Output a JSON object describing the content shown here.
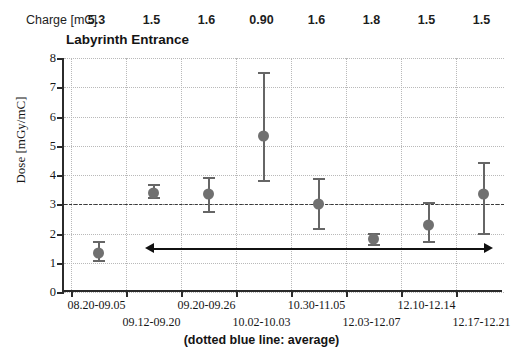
{
  "header": {
    "charge_label": "Charge [mC]",
    "charge_values": [
      "5.3",
      "1.5",
      "1.6",
      "0.90",
      "1.6",
      "1.8",
      "1.5",
      "1.5"
    ]
  },
  "caption": "(dotted blue line: average)",
  "chart_data": {
    "type": "scatter",
    "title": "Labyrinth Entrance",
    "xlabel": "",
    "ylabel": "Dose [mGy/mC]",
    "ylim": [
      0,
      8
    ],
    "yticks": [
      "0",
      "1",
      "2",
      "3",
      "4",
      "5",
      "6",
      "7",
      "8"
    ],
    "grid": true,
    "legend": "none",
    "categories": [
      "08.20-09.05",
      "09.12-09.20",
      "09.20-09.26",
      "10.02-10.03",
      "10.30-11.05",
      "12.03-12.07",
      "12.10-12.14",
      "12.17-12.21"
    ],
    "values": [
      1.35,
      3.4,
      3.35,
      5.35,
      3.0,
      1.8,
      2.3,
      3.35
    ],
    "err_low": [
      1.05,
      3.2,
      2.75,
      3.8,
      2.15,
      1.6,
      1.7,
      2.0
    ],
    "err_high": [
      1.7,
      3.65,
      3.9,
      7.5,
      3.85,
      2.0,
      3.05,
      4.4
    ],
    "average": 3.0,
    "average_style": "dash-dot",
    "annotations": [
      {
        "name": "range-arrow",
        "type": "double-arrow",
        "y": 1.5,
        "x_from": 1,
        "x_to": 7
      }
    ]
  }
}
